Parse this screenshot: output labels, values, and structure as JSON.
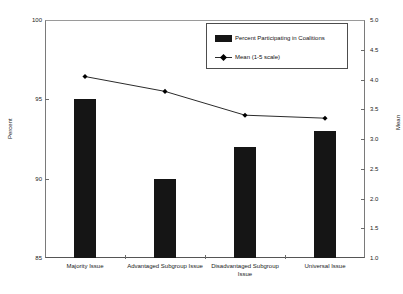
{
  "chart_data": {
    "type": "bar",
    "title": "",
    "xlabel": "",
    "ylabel": "Percent",
    "y2label": "Mean",
    "categories": [
      "Majority Issue",
      "Advantaged Subgroup Issue",
      "Disadvantaged Subgroup Issue",
      "Universal Issue"
    ],
    "series": [
      {
        "name": "Percent Participating in Coalitions",
        "type": "bar",
        "axis": "left",
        "values": [
          95,
          90,
          92,
          93
        ],
        "color": "#151515"
      },
      {
        "name": "Mean (1-5 scale)",
        "type": "line",
        "axis": "right",
        "values": [
          4.05,
          3.8,
          3.4,
          3.35
        ],
        "color": "#2b2b2b"
      }
    ],
    "ylim": [
      85,
      100
    ],
    "yticks": [
      85,
      90,
      95,
      100
    ],
    "yticklabels": [
      "85",
      "90",
      "95",
      "100"
    ],
    "y2lim": [
      1.0,
      5.0
    ],
    "y2ticks": [
      1.0,
      1.5,
      2.0,
      2.5,
      3.0,
      3.5,
      4.0,
      4.5,
      5.0
    ],
    "y2ticklabels": [
      "1.0",
      "1.5",
      "2.0",
      "2.5",
      "3.0",
      "3.5",
      "4.0",
      "4.5",
      "5.0"
    ],
    "grid": false,
    "legend_position": "upper-center",
    "legend_entries": [
      "Percent Participating in Coalitions",
      "Mean (1-5 scale)"
    ]
  }
}
